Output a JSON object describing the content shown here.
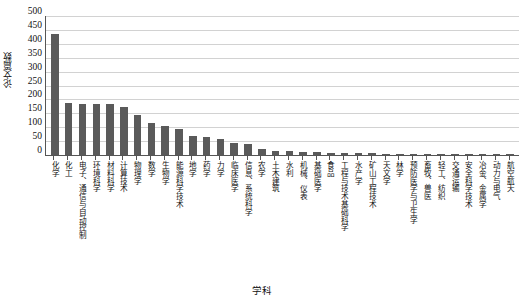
{
  "chart_data": {
    "type": "bar",
    "title": "",
    "xlabel": "学科",
    "ylabel": "论文篇数",
    "ylim": [
      0,
      500
    ],
    "yticks": [
      500,
      450,
      400,
      350,
      300,
      250,
      200,
      150,
      100,
      50,
      0
    ],
    "grid": true,
    "legend": null,
    "bar_color": "#5a5a5a",
    "grid_color": "#d2d2d2",
    "axis_color": "#555555",
    "categories": [
      "化学",
      "化工",
      "电子、通信与自动控制",
      "环境科学",
      "材料科学",
      "计算技术",
      "物理学",
      "数学",
      "生物学",
      "能源科学技术",
      "地学",
      "药学",
      "力学",
      "临床医学",
      "信息、系统科学",
      "农学",
      "土木建筑",
      "水利",
      "机械、仪表",
      "基础医学",
      "食品",
      "工程与技术基础科学",
      "水产学",
      "矿山工程技术",
      "天文学",
      "林学",
      "预防医学与卫生学",
      "畜牧、兽医",
      "轻工、纺织",
      "交通运输",
      "安全科学技术",
      "冶金、金属学",
      "动力与电气",
      "航空航天"
    ],
    "values": [
      437,
      186,
      184,
      184,
      182,
      172,
      144,
      115,
      104,
      95,
      67,
      64,
      58,
      44,
      39,
      21,
      14,
      13,
      12,
      11,
      9,
      8,
      7,
      6,
      5,
      5,
      4,
      4,
      3,
      3,
      2,
      2,
      2,
      1
    ]
  }
}
